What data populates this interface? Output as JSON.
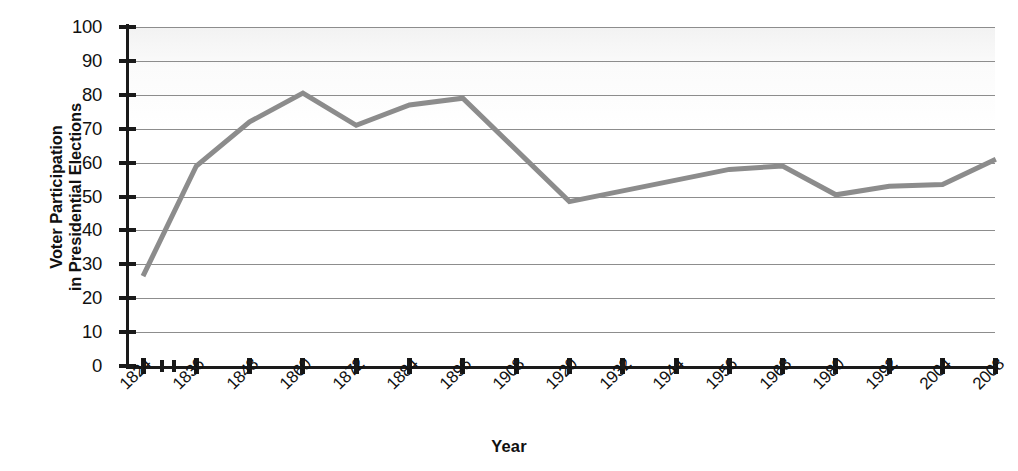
{
  "chart_data": {
    "type": "line",
    "title": "",
    "xlabel": "Year",
    "ylabel": "Voter Participation in Presidential Elections",
    "ylabel_lines": [
      "Voter Participation",
      "in Presidential Elections"
    ],
    "ylim": [
      0,
      100
    ],
    "ytick_labels": [
      "100",
      "90",
      "80",
      "70",
      "60",
      "50",
      "40",
      "30",
      "20",
      "10",
      "0"
    ],
    "ytick_values": [
      100,
      90,
      80,
      70,
      60,
      50,
      40,
      30,
      20,
      10,
      0
    ],
    "grid": true,
    "grid_axis": "y",
    "legend": false,
    "xtick_labels": [
      "1824",
      "1836",
      "1848",
      "1860",
      "1872",
      "1884",
      "1896",
      "1908",
      "1920",
      "1932",
      "1944",
      "1956",
      "1968",
      "1980",
      "1992",
      "2004",
      "2008"
    ],
    "x": [
      1824,
      1836,
      1848,
      1860,
      1872,
      1884,
      1896,
      1908,
      1920,
      1932,
      1944,
      1956,
      1968,
      1980,
      1992,
      2004,
      2008
    ],
    "series": [
      {
        "name": "Voter Participation",
        "color": "#8c8c8c",
        "values": [
          26.5,
          59,
          72,
          80.5,
          71,
          77,
          79,
          65,
          48.5,
          51.5,
          55,
          58,
          59,
          50.5,
          53,
          53.5,
          61
        ]
      }
    ],
    "points": [
      {
        "year": "1824",
        "value": 26.5
      },
      {
        "year": "1836",
        "value": 59
      },
      {
        "year": "1848",
        "value": 72
      },
      {
        "year": "1860",
        "value": 80.5
      },
      {
        "year": "1872",
        "value": 71
      },
      {
        "year": "1884",
        "value": 77
      },
      {
        "year": "1896",
        "value": 79
      },
      {
        "year": "1920",
        "value": 48.5
      },
      {
        "year": "1956",
        "value": 58
      },
      {
        "year": "1968",
        "value": 59
      },
      {
        "year": "1980",
        "value": 50.5
      },
      {
        "year": "1992",
        "value": 53
      },
      {
        "year": "2004",
        "value": 53.5
      },
      {
        "year": "2008",
        "value": 61
      }
    ],
    "vertex_years": [
      1824,
      1836,
      1848,
      1860,
      1872,
      1884,
      1896,
      1920,
      1956,
      1968,
      1980,
      1992,
      2004,
      2008
    ],
    "colors": {
      "line": "#8c8c8c",
      "grid": "#8d8d8d",
      "axis": "#1a1a1a",
      "text": "#111111",
      "plot_background": "#ffffff"
    }
  }
}
